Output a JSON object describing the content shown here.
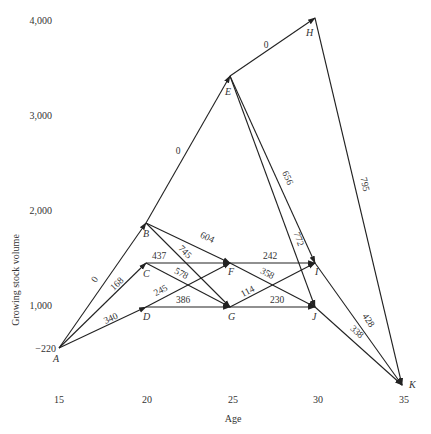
{
  "diagram": {
    "type": "network",
    "xlabel": "Age",
    "ylabel": "Growing stock volume",
    "x_ticks": [
      "15",
      "20",
      "25",
      "30",
      "35"
    ],
    "y_ticks": [
      "4,000",
      "3,000",
      "2,000",
      "1,000",
      "−220"
    ],
    "nodes": [
      {
        "id": "A",
        "age": 15,
        "volume": 220
      },
      {
        "id": "B",
        "age": 20,
        "volume": 1850
      },
      {
        "id": "C",
        "age": 20,
        "volume": 1450
      },
      {
        "id": "D",
        "age": 20,
        "volume": 1000
      },
      {
        "id": "E",
        "age": 25,
        "volume": 3450
      },
      {
        "id": "F",
        "age": 25,
        "volume": 1450
      },
      {
        "id": "G",
        "age": 25,
        "volume": 1000
      },
      {
        "id": "H",
        "age": 30,
        "volume": 4050
      },
      {
        "id": "I",
        "age": 30,
        "volume": 1450
      },
      {
        "id": "J",
        "age": 30,
        "volume": 1000
      },
      {
        "id": "K",
        "age": 35,
        "volume": 200
      }
    ],
    "edges": [
      {
        "from": "A",
        "to": "B",
        "label": "0"
      },
      {
        "from": "A",
        "to": "C",
        "label": "168"
      },
      {
        "from": "A",
        "to": "D",
        "label": "340"
      },
      {
        "from": "B",
        "to": "E",
        "label": "0"
      },
      {
        "from": "B",
        "to": "F",
        "label": "604"
      },
      {
        "from": "B",
        "to": "G",
        "label": "745"
      },
      {
        "from": "C",
        "to": "F",
        "label": "437"
      },
      {
        "from": "C",
        "to": "G",
        "label": "578"
      },
      {
        "from": "D",
        "to": "F",
        "label": "245"
      },
      {
        "from": "D",
        "to": "G",
        "label": "386"
      },
      {
        "from": "E",
        "to": "H",
        "label": "0"
      },
      {
        "from": "E",
        "to": "I",
        "label": "656"
      },
      {
        "from": "E",
        "to": "J",
        "label": "772"
      },
      {
        "from": "F",
        "to": "I",
        "label": "242"
      },
      {
        "from": "F",
        "to": "J",
        "label": "358"
      },
      {
        "from": "G",
        "to": "I",
        "label": "114"
      },
      {
        "from": "G",
        "to": "J",
        "label": "230"
      },
      {
        "from": "H",
        "to": "K",
        "label": "795"
      },
      {
        "from": "I",
        "to": "K",
        "label": "428"
      },
      {
        "from": "J",
        "to": "K",
        "label": "338"
      }
    ]
  }
}
